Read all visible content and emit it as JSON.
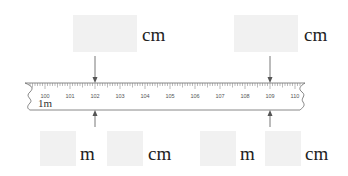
{
  "top_answers": [
    {
      "unit": "cm",
      "points_to": "102"
    },
    {
      "unit": "cm",
      "points_to": "109"
    }
  ],
  "bottom_answers": [
    {
      "first_unit": "m",
      "second_unit": "cm",
      "points_to": "102"
    },
    {
      "first_unit": "m",
      "second_unit": "cm",
      "points_to": "109"
    }
  ],
  "ruler": {
    "start_cm": 100,
    "end_cm": 110,
    "tick_labels": [
      "100",
      "101",
      "102",
      "103",
      "104",
      "105",
      "106",
      "107",
      "108",
      "109",
      "110"
    ],
    "meter_label": "1m",
    "marked_values": [
      102,
      109
    ]
  },
  "colors": {
    "answer_box": "#f1f1f1",
    "ruler_line": "#888888",
    "arrow": "#555555"
  }
}
